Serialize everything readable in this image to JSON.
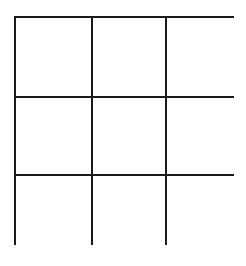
{
  "canvas": {
    "width": 246,
    "height": 266,
    "background_color": "#ffffff"
  },
  "grid": {
    "kind": "empty-3x3-grid",
    "rows": 3,
    "columns": 3,
    "line_color": "#1a1a1a",
    "cell_fill_color": "#ffffff",
    "line_width_px": 2,
    "border_width_px": 2,
    "bounds": {
      "left": 14,
      "top": 16,
      "right": 234,
      "bottom": 245,
      "width": 220,
      "height": 229
    },
    "column_widths_px": [
      75,
      72,
      73
    ],
    "row_heights_px": [
      78,
      76,
      75
    ],
    "vertical_divider_x": [
      89,
      161
    ],
    "horizontal_divider_y": [
      94,
      170
    ],
    "cells": [
      {
        "row": 0,
        "col": 0,
        "label": "",
        "name": "grid-cell-r0-c0"
      },
      {
        "row": 0,
        "col": 1,
        "label": "",
        "name": "grid-cell-r0-c1"
      },
      {
        "row": 0,
        "col": 2,
        "label": "",
        "name": "grid-cell-r0-c2"
      },
      {
        "row": 1,
        "col": 0,
        "label": "",
        "name": "grid-cell-r1-c0"
      },
      {
        "row": 1,
        "col": 1,
        "label": "",
        "name": "grid-cell-r1-c1"
      },
      {
        "row": 1,
        "col": 2,
        "label": "",
        "name": "grid-cell-r1-c2"
      },
      {
        "row": 2,
        "col": 0,
        "label": "",
        "name": "grid-cell-r2-c0"
      },
      {
        "row": 2,
        "col": 1,
        "label": "",
        "name": "grid-cell-r2-c1"
      },
      {
        "row": 2,
        "col": 2,
        "label": "",
        "name": "grid-cell-r2-c2"
      }
    ]
  }
}
